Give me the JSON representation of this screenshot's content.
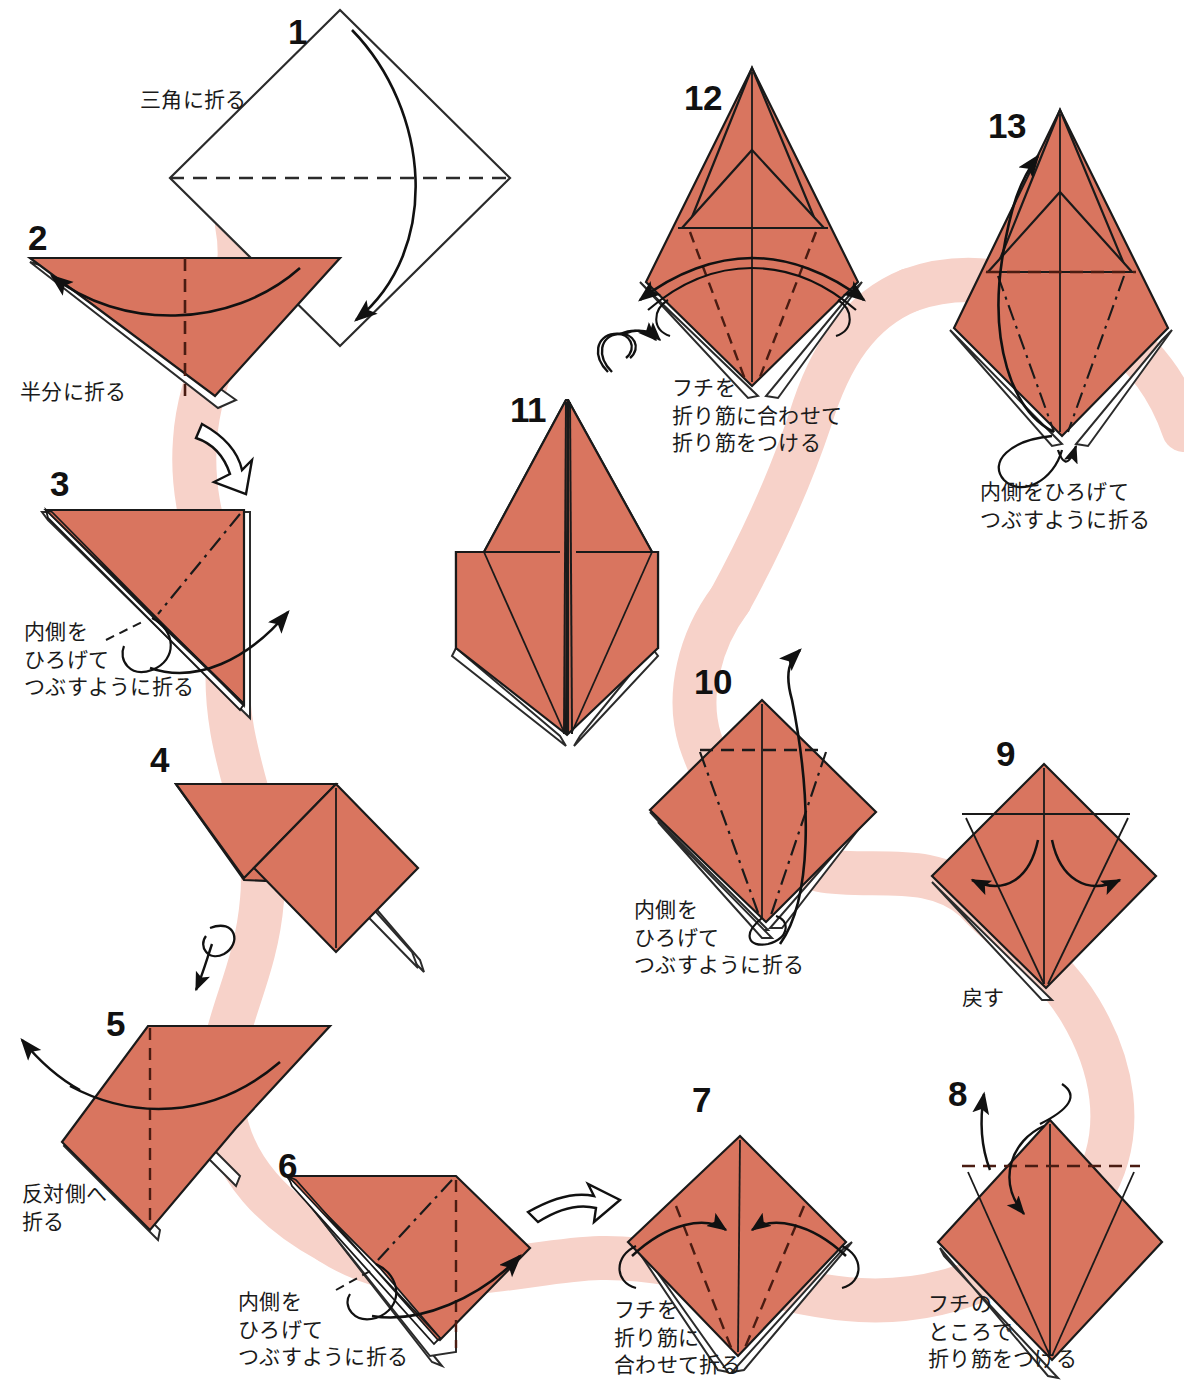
{
  "page": {
    "paper_color": "#d9755f",
    "paper_color_shade": "#cf6952",
    "paper_edge_color": "#1a1a1a",
    "ribbon_color": "#f7d2c9",
    "background": "#ffffff",
    "text_color": "#1a1a1a",
    "width": 1184,
    "height": 1390
  },
  "steps": [
    {
      "id": "step-1",
      "number": "1",
      "caption": "三角に折る"
    },
    {
      "id": "step-2",
      "number": "2",
      "caption": "半分に折る"
    },
    {
      "id": "step-3",
      "number": "3",
      "caption": "内側を\nひろげて\nつぶすように折る"
    },
    {
      "id": "step-4",
      "number": "4",
      "caption": ""
    },
    {
      "id": "step-5",
      "number": "5",
      "caption": "反対側へ\n折る"
    },
    {
      "id": "step-6",
      "number": "6",
      "caption": "内側を\nひろげて\nつぶすように折る"
    },
    {
      "id": "step-7",
      "number": "7",
      "caption": "フチを\n折り筋に\n合わせて折る"
    },
    {
      "id": "step-8",
      "number": "8",
      "caption": "フチの\nところで\n折り筋をつける"
    },
    {
      "id": "step-9",
      "number": "9",
      "caption": "戻す"
    },
    {
      "id": "step-10",
      "number": "10",
      "caption": "内側を\nひろげて\nつぶすように折る"
    },
    {
      "id": "step-11",
      "number": "11",
      "caption": ""
    },
    {
      "id": "step-12",
      "number": "12",
      "caption": "フチを\n折り筋に合わせて\n折り筋をつける"
    },
    {
      "id": "step-13",
      "number": "13",
      "caption": "内側をひろげて\nつぶすように折る"
    }
  ],
  "symbols": {
    "turn_over_arrow": "turnover-loop-arrow",
    "hollow_arrow": "hollow-progress-arrow",
    "valley_fold": "dashed-line",
    "mountain_fold": "dash-dot-line",
    "fold_arrow": "curved-solid-arrow"
  }
}
